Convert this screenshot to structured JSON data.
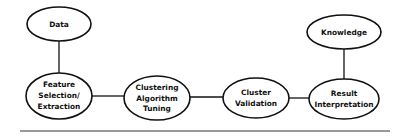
{
  "diagram": {
    "nodes": [
      {
        "id": "data",
        "lines": [
          "Data"
        ]
      },
      {
        "id": "feature",
        "lines": [
          "Feature",
          "Selection/",
          "Extraction"
        ]
      },
      {
        "id": "clustering",
        "lines": [
          "Clustering",
          "Algorithm",
          "Tuning"
        ]
      },
      {
        "id": "validation",
        "lines": [
          "Cluster",
          "Validation"
        ]
      },
      {
        "id": "result",
        "lines": [
          "Result",
          "Interpretation"
        ]
      },
      {
        "id": "knowledge",
        "lines": [
          "Knowledge"
        ]
      }
    ],
    "edges": [
      {
        "from": "data",
        "to": "feature"
      },
      {
        "from": "feature",
        "to": "clustering"
      },
      {
        "from": "clustering",
        "to": "validation"
      },
      {
        "from": "validation",
        "to": "result"
      },
      {
        "from": "result",
        "to": "knowledge"
      }
    ],
    "colors": {
      "stroke": "#111111",
      "fill": "#ffffff",
      "rule": "#777777"
    }
  }
}
